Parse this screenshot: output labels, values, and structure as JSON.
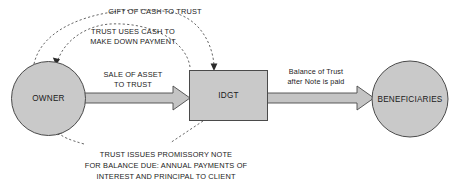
{
  "diagram": {
    "colors": {
      "node_fill": "#c9c9c9",
      "node_stroke": "#4a4a4a",
      "arrow_fill": "#c4c4c4",
      "dash_stroke": "#555555",
      "text": "#1a1a1a",
      "background": "#ffffff"
    },
    "nodes": [
      {
        "id": "owner",
        "label": "OWNER",
        "shape": "circle"
      },
      {
        "id": "idgt",
        "label": "IDGT",
        "shape": "rectangle"
      },
      {
        "id": "beneficiaries",
        "label": "BENEFICIARIES",
        "shape": "circle"
      }
    ],
    "solid_edges": [
      {
        "id": "sale-of-asset",
        "from": "owner",
        "to": "idgt",
        "style": "block-arrow",
        "label_lines": [
          "SALE OF ASSET",
          "TO TRUST"
        ]
      },
      {
        "id": "balance-of-trust",
        "from": "idgt",
        "to": "beneficiaries",
        "style": "block-arrow",
        "label_lines": [
          "Balance of Trust",
          "after Note is paid"
        ]
      }
    ],
    "dashed_edges": [
      {
        "id": "gift-of-cash",
        "from": "owner",
        "to": "idgt",
        "style": "dashed-arc",
        "label_lines": [
          "GIFT OF CASH TO TRUST"
        ]
      },
      {
        "id": "trust-uses-cash",
        "from": "owner",
        "to": "idgt",
        "style": "dashed-arc",
        "label_lines": [
          "TRUST USES CASH TO",
          "MAKE DOWN PAYMENT"
        ]
      },
      {
        "id": "promissory-note",
        "from": "idgt",
        "to": "owner",
        "style": "dashed-arc",
        "label_lines": [
          "TRUST ISSUES PROMISSORY NOTE",
          "FOR BALANCE DUE: ANNUAL PAYMENTS OF",
          "INTEREST AND PRINCIPAL TO CLIENT"
        ]
      }
    ]
  }
}
